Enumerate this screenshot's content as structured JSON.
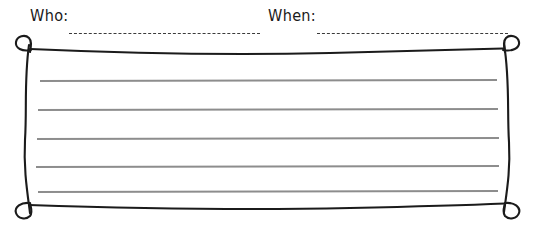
{
  "page": {
    "kind": "worksheet-note-card",
    "background_color": "#ffffff"
  },
  "header": {
    "fields": [
      {
        "label": "Who:",
        "value": "",
        "blank_style": "dashed-line"
      },
      {
        "label": "When:",
        "value": "",
        "blank_style": "dashed-line"
      }
    ]
  },
  "frame": {
    "style": "hand-drawn",
    "stroke_color": "#1b1b1b",
    "corner_ornament": "loop-curl",
    "corners": [
      "top-left",
      "top-right",
      "bottom-left",
      "bottom-right"
    ]
  },
  "writing_area": {
    "line_color": "#8d8d8d",
    "line_count": 5,
    "lines": [
      "",
      "",
      "",
      "",
      ""
    ]
  }
}
